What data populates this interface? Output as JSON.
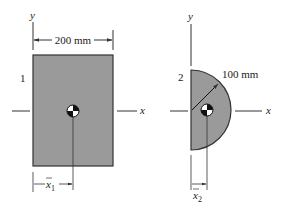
{
  "figure": {
    "colors": {
      "fill": "#9a9a9a",
      "stroke": "#333333",
      "line": "#333333",
      "text": "#1a1a1a"
    },
    "shape1": {
      "label": "1",
      "type": "rectangle",
      "width_label": "200 mm",
      "axis_y_label": "y",
      "axis_x_label": "x",
      "centroid_label_base": "x",
      "centroid_label_sub": "1"
    },
    "shape2": {
      "label": "2",
      "type": "semicircle",
      "radius_label": "100 mm",
      "axis_y_label": "y",
      "axis_x_label": "x",
      "centroid_label_base": "x",
      "centroid_label_sub": "2"
    }
  }
}
